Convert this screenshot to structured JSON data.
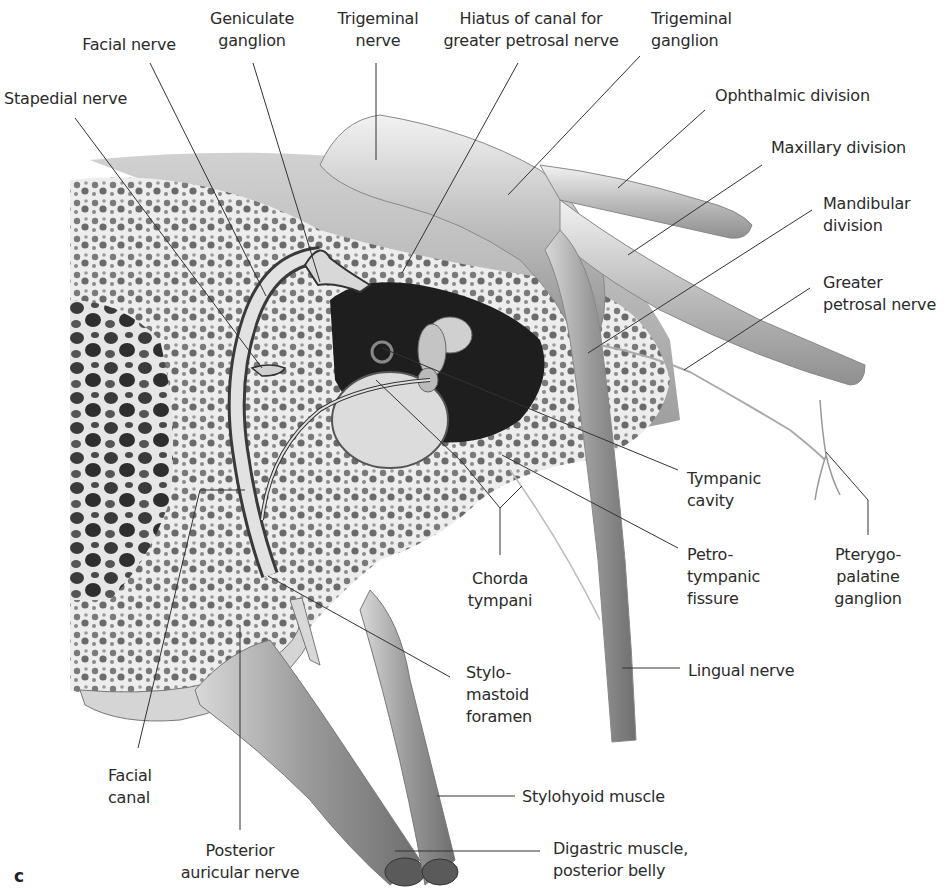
{
  "figure": {
    "panel_letter": "c"
  },
  "labels": {
    "stapedial_nerve": {
      "lines": [
        "Stapedial nerve"
      ]
    },
    "facial_nerve": {
      "lines": [
        "Facial nerve"
      ]
    },
    "geniculate_ganglion": {
      "lines": [
        "Geniculate",
        "ganglion"
      ]
    },
    "trigeminal_nerve": {
      "lines": [
        "Trigeminal",
        "nerve"
      ]
    },
    "hiatus": {
      "lines": [
        "Hiatus of canal for",
        "greater petrosal nerve"
      ]
    },
    "trigeminal_ganglion": {
      "lines": [
        "Trigeminal",
        "ganglion"
      ]
    },
    "ophthalmic_division": {
      "lines": [
        "Ophthalmic division"
      ]
    },
    "maxillary_division": {
      "lines": [
        "Maxillary division"
      ]
    },
    "mandibular_division": {
      "lines": [
        "Mandibular",
        "division"
      ]
    },
    "greater_petrosal_nerve": {
      "lines": [
        "Greater",
        "petrosal nerve"
      ]
    },
    "tympanic_cavity": {
      "lines": [
        "Tympanic",
        "cavity"
      ]
    },
    "petrotympanic_fissure": {
      "lines": [
        "Petro-",
        "tympanic",
        "fissure"
      ]
    },
    "pterygopalatine_ganglion": {
      "lines": [
        "Pterygo-",
        "palatine",
        "ganglion"
      ]
    },
    "chorda_tympani": {
      "lines": [
        "Chorda",
        "tympani"
      ]
    },
    "lingual_nerve": {
      "lines": [
        "Lingual nerve"
      ]
    },
    "stylomastoid_foramen": {
      "lines": [
        "Stylo-",
        "mastoid",
        "foramen"
      ]
    },
    "facial_canal": {
      "lines": [
        "Facial",
        "canal"
      ]
    },
    "stylohyoid_muscle": {
      "lines": [
        "Stylohyoid muscle"
      ]
    },
    "posterior_auricular_nerve": {
      "lines": [
        "Posterior",
        "auricular nerve"
      ]
    },
    "digastric_muscle": {
      "lines": [
        "Digastric muscle,",
        "posterior belly"
      ]
    }
  },
  "colors": {
    "background": "#ffffff",
    "text": "#2b2b2b",
    "leader_line": "#333333",
    "bone_light": "#e9e9e9",
    "bone_dark": "#5a5a5a",
    "nerve": "#cfcfcf",
    "cavity": "#1c1c1c"
  }
}
